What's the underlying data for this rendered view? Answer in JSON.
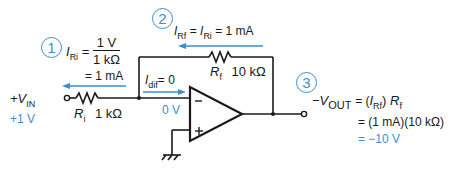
{
  "colors": {
    "wire": "#1a1a1a",
    "annotation": "#3a8fd0"
  },
  "steps": {
    "step1": {
      "number": "1",
      "current": "I",
      "current_sub": "Ri",
      "eq": "=",
      "numerator": "1 V",
      "denominator": "1 kΩ",
      "result": "= 1 mA"
    },
    "step2": {
      "number": "2",
      "lhs": "I",
      "lhs_sub": "Rf",
      "mid": "= ",
      "mid_i": "I",
      "mid_sub": "Ri",
      "result": "= 1 mA"
    },
    "step3": {
      "number": "3",
      "lhs_prefix": "−V",
      "lhs_sub": "OUT",
      "eq1": "= (",
      "eq1_i": "I",
      "eq1_sub": "Rf",
      "eq1_close": ") ",
      "eq1_r": "R",
      "eq1_r_sub": "f",
      "line2": "= (1 mA)(10 kΩ)",
      "line3": "= −10 V"
    }
  },
  "components": {
    "input": {
      "label_prefix": "+V",
      "label_sub": "IN",
      "value": "+1 V"
    },
    "ri": {
      "label": "R",
      "label_sub": "i",
      "value": "1 kΩ"
    },
    "rf": {
      "label": "R",
      "label_sub": "f",
      "value": "10 kΩ"
    },
    "idif": {
      "label": "I",
      "label_sub": "dif",
      "value": "= 0"
    },
    "inverting_node_voltage": "0 V",
    "opamp": {
      "inverting_symbol": "−",
      "noninverting_symbol": "+"
    }
  }
}
